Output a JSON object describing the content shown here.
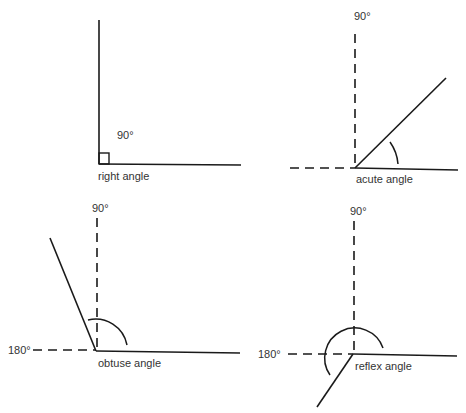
{
  "diagram": {
    "colors": {
      "stroke": "#1a1a1a",
      "text": "#333333",
      "background": "#ffffff"
    },
    "panels": [
      {
        "id": "right",
        "name": "right angle",
        "labels": {
          "top": "90°"
        },
        "vertex": [
          99,
          164
        ]
      },
      {
        "id": "acute",
        "name": "acute angle",
        "labels": {
          "top": "90°"
        },
        "vertex": [
          355,
          168
        ]
      },
      {
        "id": "obtuse",
        "name": "obtuse angle",
        "labels": {
          "top": "90°",
          "left": "180°"
        },
        "vertex": [
          96,
          351
        ]
      },
      {
        "id": "reflex",
        "name": "reflex angle",
        "labels": {
          "top": "90°",
          "left": "180°"
        },
        "vertex": [
          353,
          354
        ]
      }
    ]
  }
}
